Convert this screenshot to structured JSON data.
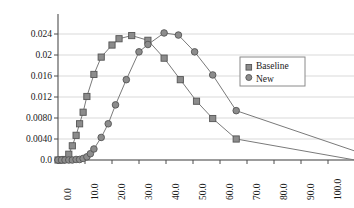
{
  "chart_data": {
    "type": "line",
    "title": "",
    "xlabel": "",
    "ylabel": "",
    "xlim": [
      0,
      110
    ],
    "ylim": [
      0,
      0.0262
    ],
    "grid": true,
    "legend_position": "right",
    "x_ticks": [
      "0.0",
      "10.0",
      "20.0",
      "30.0",
      "40.0",
      "50.0",
      "60.0",
      "70.0",
      "80.0",
      "90.0",
      "100.0"
    ],
    "x_tick_values": [
      0,
      10,
      20,
      30,
      40,
      50,
      60,
      70,
      80,
      90,
      100
    ],
    "y_ticks": [
      "0.0",
      "0.0040",
      "0.0080",
      "0.012",
      "0.016",
      "0.02",
      "0.024"
    ],
    "y_tick_values": [
      0,
      0.004,
      0.008,
      0.012,
      0.016,
      0.02,
      0.024
    ],
    "series": [
      {
        "name": "Baseline",
        "marker": "square",
        "color": "#808080",
        "points": [
          [
            0.0,
            0.0
          ],
          [
            1.3,
            0.0
          ],
          [
            2.6,
            0.0001
          ],
          [
            4.0,
            0.0011
          ],
          [
            5.3,
            0.0027
          ],
          [
            6.7,
            0.0047
          ],
          [
            8.0,
            0.0069
          ],
          [
            9.3,
            0.0091
          ],
          [
            10.7,
            0.0121
          ],
          [
            13.3,
            0.0163
          ],
          [
            16.0,
            0.0196
          ],
          [
            20.0,
            0.0219
          ],
          [
            22.6,
            0.0231
          ],
          [
            27.3,
            0.0237
          ],
          [
            33.3,
            0.0228
          ],
          [
            39.3,
            0.0194
          ],
          [
            45.3,
            0.0153
          ],
          [
            51.3,
            0.0112
          ],
          [
            57.3,
            0.0079
          ],
          [
            66.0,
            0.004
          ],
          [
            110.0,
            0.0
          ]
        ]
      },
      {
        "name": "New",
        "marker": "circle",
        "color": "#808080",
        "points": [
          [
            0.0,
            0.0
          ],
          [
            1.3,
            0.0
          ],
          [
            2.6,
            0.0
          ],
          [
            4.0,
            0.0
          ],
          [
            5.3,
            0.0
          ],
          [
            6.7,
            0.0001
          ],
          [
            8.0,
            0.0001
          ],
          [
            9.3,
            0.0003
          ],
          [
            10.7,
            0.0006
          ],
          [
            12.0,
            0.0012
          ],
          [
            13.3,
            0.0021
          ],
          [
            16.0,
            0.0043
          ],
          [
            18.6,
            0.0069
          ],
          [
            21.3,
            0.0105
          ],
          [
            25.3,
            0.0153
          ],
          [
            30.0,
            0.0206
          ],
          [
            33.3,
            0.022
          ],
          [
            39.3,
            0.0242
          ],
          [
            44.6,
            0.0238
          ],
          [
            50.6,
            0.0206
          ],
          [
            57.3,
            0.0162
          ],
          [
            66.0,
            0.0094
          ],
          [
            110.0,
            0.0017
          ]
        ]
      }
    ]
  },
  "legend": {
    "entries": [
      {
        "label": "Baseline",
        "marker": "square"
      },
      {
        "label": "New",
        "marker": "circle"
      }
    ]
  },
  "colors": {
    "line": "#7a7a7a",
    "marker_fill": "#8c8c8c",
    "marker_stroke": "#555555",
    "grid": "#d9d9d9",
    "axis": "#4d4d4d",
    "text": "#1a1a1a",
    "legend_border": "#8a8a8a"
  }
}
